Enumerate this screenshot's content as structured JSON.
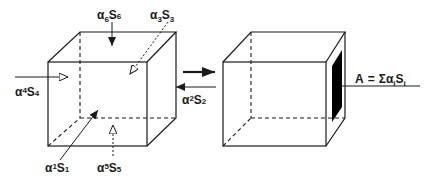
{
  "diagram": {
    "type": "absorption-area-concept",
    "left_cube": {
      "surface_labels": [
        {
          "id": "s1",
          "alpha": "α",
          "alpha_sub": "1",
          "s": "S",
          "s_sub": "1"
        },
        {
          "id": "s2",
          "alpha": "α",
          "alpha_sub": "2",
          "s": "S",
          "s_sub": "2"
        },
        {
          "id": "s3",
          "alpha": "α",
          "alpha_sub": "3",
          "s": "S",
          "s_sub": "3"
        },
        {
          "id": "s4",
          "alpha": "α",
          "alpha_sub": "4",
          "s": "S",
          "s_sub": "4"
        },
        {
          "id": "s5",
          "alpha": "α",
          "alpha_sub": "5",
          "s": "S",
          "s_sub": "5"
        },
        {
          "id": "s6",
          "alpha": "α",
          "alpha_sub": "6",
          "s": "S",
          "s_sub": "6"
        }
      ]
    },
    "transform_arrow": "equivalent-to",
    "right_cube": {
      "equivalent_area_label": {
        "lhs": "A",
        "eq": "=",
        "sigma": "Σ",
        "alpha": "α",
        "alpha_sub": "i",
        "s": "S",
        "s_sub": "i"
      }
    },
    "colors": {
      "line": "#1a1a1a",
      "absorber_panel": "#000000",
      "background": "#ffffff"
    }
  }
}
